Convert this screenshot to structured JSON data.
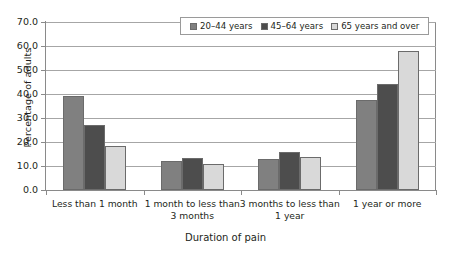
{
  "chart_data": {
    "type": "bar",
    "title": "",
    "xlabel": "Duration of pain",
    "ylabel": "Percentage of adults",
    "categories": [
      "Less than 1 month",
      "1 month to less than 3 months",
      "3 months to less than 1 year",
      "1 year or more"
    ],
    "series": [
      {
        "name": "20–44 years",
        "color": "#808080",
        "values": [
          39.0,
          12.0,
          12.8,
          37.5
        ]
      },
      {
        "name": "45–64 years",
        "color": "#4d4d4d",
        "values": [
          27.0,
          13.5,
          15.8,
          44.0
        ]
      },
      {
        "name": "65 years and over",
        "color": "#d9d9d9",
        "values": [
          18.5,
          11.0,
          13.8,
          58.0
        ]
      }
    ],
    "ylim": [
      0,
      70
    ],
    "yticks": [
      0.0,
      10.0,
      20.0,
      30.0,
      40.0,
      50.0,
      60.0,
      70.0
    ],
    "ytick_labels": [
      "0.0",
      "10.0",
      "20.0",
      "30.0",
      "40.0",
      "50.0",
      "60.0",
      "70.0"
    ],
    "grid": true,
    "legend_position": "top-center"
  },
  "legend": {
    "entries": [
      {
        "label": "20–44 years"
      },
      {
        "label": "45–64 years"
      },
      {
        "label": "65 years and over"
      }
    ]
  },
  "axes": {
    "y_title": "Percentage of adults",
    "x_title": "Duration of pain",
    "x_categories": [
      {
        "line1": "Less than 1 month",
        "line2": ""
      },
      {
        "line1": "1 month to less than",
        "line2": "3 months"
      },
      {
        "line1": "3 months to less than",
        "line2": "1 year"
      },
      {
        "line1": "1 year or more",
        "line2": ""
      }
    ]
  }
}
